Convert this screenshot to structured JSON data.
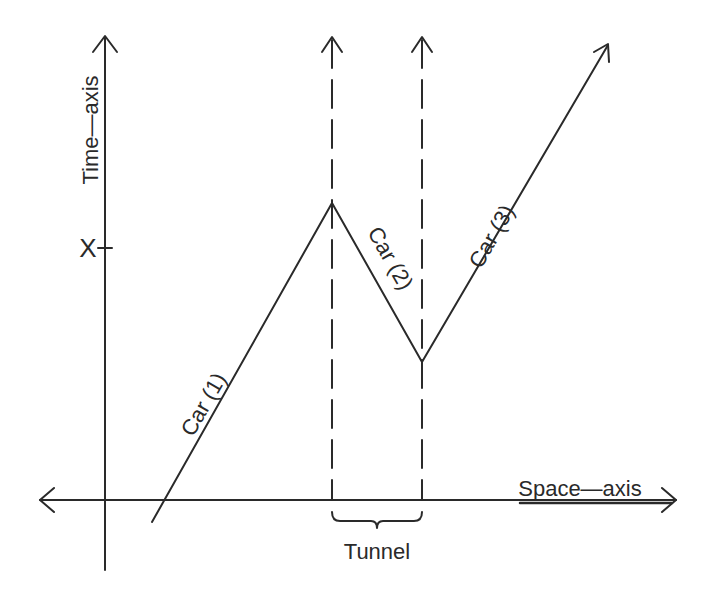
{
  "diagram": {
    "ink_color": "#2a2a2a",
    "background": "#ffffff",
    "axes": {
      "time_axis_label": "Time—axis",
      "space_axis_label": "Space—axis",
      "tick_label": "X"
    },
    "lines": [
      {
        "id": "car1",
        "label": "Car (1)",
        "from": [
          152,
          522
        ],
        "to": [
          332,
          203
        ]
      },
      {
        "id": "car2",
        "label": "Car (2)",
        "from": [
          332,
          203
        ],
        "to": [
          422,
          362
        ]
      },
      {
        "id": "car3",
        "label": "Car (3)",
        "from": [
          422,
          362
        ],
        "to": [
          608,
          44
        ]
      }
    ],
    "tunnel": {
      "label": "Tunnel",
      "left_x": 332,
      "right_x": 422
    }
  }
}
